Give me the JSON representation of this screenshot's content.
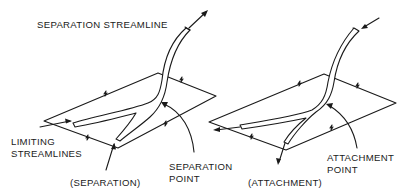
{
  "diagram": {
    "ink_color": "#1a1a1a",
    "background_color": "#ffffff",
    "left_panel": {
      "labels": {
        "separation_streamline": "SEPARATION STREAMLINE",
        "limiting_streamlines_line1": "LIMITING",
        "limiting_streamlines_line2": "STREAMLINES",
        "separation_point_line1": "SEPARATION",
        "separation_point_line2": "POINT",
        "caption": "(SEPARATION)"
      }
    },
    "right_panel": {
      "labels": {
        "attachment_point_line1": "ATTACHMENT",
        "attachment_point_line2": "POINT",
        "caption": "(ATTACHMENT)"
      }
    }
  }
}
